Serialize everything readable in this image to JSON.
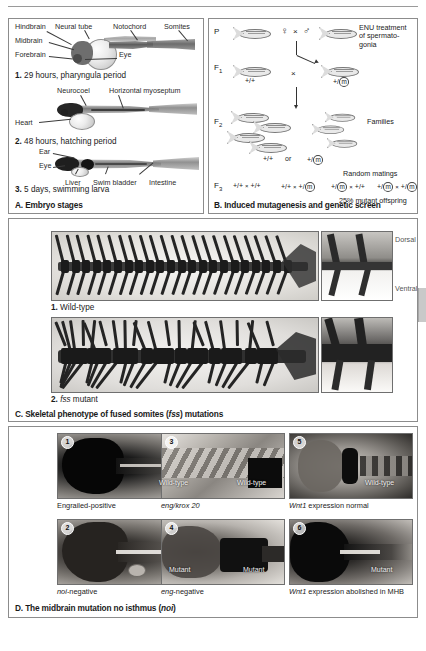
{
  "panel_a": {
    "caption": "A. Embryo stages",
    "stages": [
      {
        "num": "1.",
        "text": " 29 hours, pharyngula period"
      },
      {
        "num": "2.",
        "text": " 48 hours, hatching period"
      },
      {
        "num": "3.",
        "text": " 5 days, swimming larva"
      }
    ],
    "labels_stage1": [
      "Hindbrain",
      "Neural tube",
      "Notochord",
      "Somites",
      "Midbrain",
      "Forebrain",
      "Eye"
    ],
    "labels_stage2": [
      "Neurocoel",
      "Horizontal myoseptum",
      "Heart"
    ],
    "labels_stage3": [
      "Ear",
      "Eye",
      "Liver",
      "Swim bladder",
      "Intestine"
    ]
  },
  "panel_b": {
    "caption": "B. Induced mutagenesis and genetic screen",
    "generations": [
      "P",
      "F",
      "F",
      "F"
    ],
    "gen_subs": [
      "",
      "1",
      "2",
      "3"
    ],
    "enu_text": "ENU treatment of spermato-gonia",
    "female_symbol": "♀",
    "male_symbol": "♂",
    "cross_symbol": "×",
    "f1_genotypes": [
      "+/+",
      "+/m"
    ],
    "f2_genotypes": [
      "+/+",
      "or",
      "+/m"
    ],
    "families_label": "Families",
    "random_matings_label": "Random matings",
    "f3_crosses": [
      {
        "left": "+/+",
        "right": "+/+"
      },
      {
        "left": "+/+",
        "right": "+/m"
      },
      {
        "left": "+/m",
        "right": "+/+"
      },
      {
        "left": "+/m",
        "right": "+/m"
      }
    ],
    "offspring_note": "25% mutant offspring"
  },
  "panel_c": {
    "caption_parts": {
      "pre": "C. Skeletal phenotype of fused somites (",
      "gene": "fss",
      "post": ") mutations"
    },
    "rows": [
      {
        "num": "1.",
        "label": " Wild-type",
        "gene": "",
        "suffix": ""
      },
      {
        "num": "2.",
        "label": " ",
        "gene": "fss",
        "suffix": " mutant"
      }
    ],
    "orientation": [
      "Dorsal",
      "Ventral"
    ]
  },
  "panel_d": {
    "caption_parts": {
      "pre": "D. The midbrain mutation no isthmus (",
      "gene": "noi",
      "post": ")"
    },
    "images": [
      {
        "num": "1",
        "overlay": "Wild-type"
      },
      {
        "num": "2",
        "overlay": "Mutant"
      },
      {
        "num": "3",
        "overlay": "Wild-type"
      },
      {
        "num": "4",
        "overlay": "Mutant"
      },
      {
        "num": "5",
        "overlay": "Wild-type"
      },
      {
        "num": "6",
        "overlay": "Mutant"
      }
    ],
    "captions": [
      {
        "plain": "Engrailed-positive",
        "gene": "",
        "post": ""
      },
      {
        "plain": "",
        "gene": "noi",
        "post": "-negative"
      },
      {
        "plain": "",
        "gene": "eng/krox 20",
        "post": ""
      },
      {
        "plain": "",
        "gene": "eng",
        "post": "-negative"
      },
      {
        "plain": "",
        "gene": "Wnt1",
        "post": " expression normal"
      },
      {
        "plain": "",
        "gene": "Wnt1",
        "post": " expression abolished in MHB"
      }
    ]
  }
}
